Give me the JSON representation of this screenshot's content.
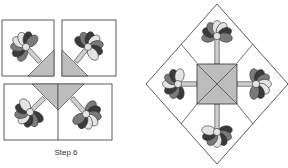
{
  "caption": "Step 6",
  "colors": {
    "dark": "#3a3a3a",
    "mid": "#7a7a7a",
    "light": "#e4e4e4",
    "triangle": "#bdbdbd",
    "stem": "#cfcfcf",
    "outline": "#333333"
  },
  "figures": [
    {
      "name": "step6-blocks",
      "description": "Four flower blocks with half-square triangles"
    },
    {
      "name": "assembled-block",
      "description": "Assembled block set on point with center square"
    }
  ]
}
